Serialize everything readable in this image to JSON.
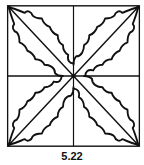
{
  "figure": {
    "type": "quilt-block-diagram",
    "stroke_color": "#111111",
    "background_color": "#ffffff",
    "elements": [
      "outer-square",
      "vertical-midline",
      "horizontal-midline",
      "diagonal-tl-br",
      "diagonal-tr-bl",
      "holly-leaf-top-left",
      "holly-leaf-top-right",
      "holly-leaf-bottom-right",
      "holly-leaf-bottom-left"
    ]
  },
  "caption": "5.22"
}
